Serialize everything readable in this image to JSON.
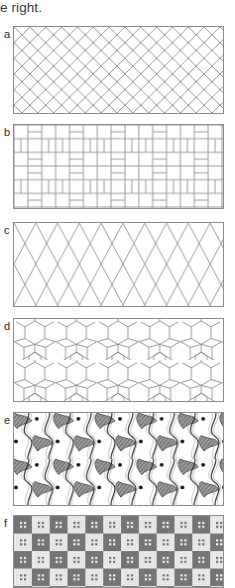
{
  "figure": {
    "body_text": "e right.",
    "panels": [
      {
        "label": "a",
        "name": "herringbone-brick-tiling",
        "description": "Herringbone brick pattern of identical 2:1 rectangles laid at plus and minus 45 degrees",
        "top": 26,
        "height": 88,
        "motif": "rectangle",
        "module_px": 16
      },
      {
        "label": "b",
        "name": "interlocking-rectangle-tiling",
        "description": "Pinwheel tiling of interlocking L-shaped and rectangular tiles",
        "top": 124,
        "height": 85,
        "motif": "rectangle-pinwheel",
        "module_px": 14
      },
      {
        "label": "c",
        "name": "diamond-lattice-tiling",
        "description": "Diagonal crosshatch lattice of tall narrow diamonds",
        "top": 222,
        "height": 85,
        "motif": "diamond",
        "module_px": 22
      },
      {
        "label": "d",
        "name": "islamic-star-tiling",
        "description": "Periodic Islamic geometric tiling of hexagons, pentagons and six-point stars",
        "top": 318,
        "height": 84,
        "motif": "hexagon-star",
        "module_px": 34
      },
      {
        "label": "e",
        "name": "escher-organic-tessellation",
        "description": "Escher-style interlocking organic creature tessellation with S-curved bodies, hatched wings and eye dots",
        "top": 412,
        "height": 94,
        "motif": "organic-creature",
        "module_px": 42
      },
      {
        "label": "f",
        "name": "checkerboard-quilt-tiling",
        "description": "Checkerboard of light and dark woven squares, each bearing a four-dot cross motif",
        "top": 515,
        "height": 73,
        "motif": "checker-square",
        "module_px": 18
      }
    ]
  },
  "colors": {
    "border": "#8c8c8c",
    "line": "#8e8e8e",
    "ink": "#2e2e2e",
    "text": "#3a3a3a",
    "quilt_dark": "#6e6e6e",
    "quilt_light": "#f2f2f2",
    "page_background": "#ffffff"
  }
}
